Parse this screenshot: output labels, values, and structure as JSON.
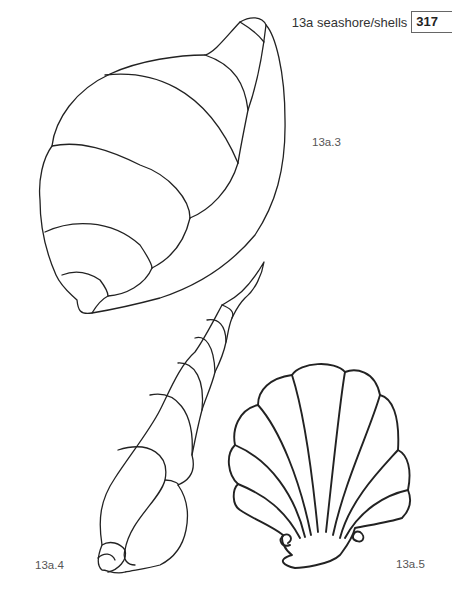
{
  "header": {
    "section": "13a  seashore/shells",
    "page_number": "317"
  },
  "figures": [
    {
      "id": "13a.3",
      "label": "13a.3",
      "subject": "whelk-shell"
    },
    {
      "id": "13a.4",
      "label": "13a.4",
      "subject": "auger-shell"
    },
    {
      "id": "13a.5",
      "label": "13a.5",
      "subject": "scallop-shell"
    }
  ]
}
